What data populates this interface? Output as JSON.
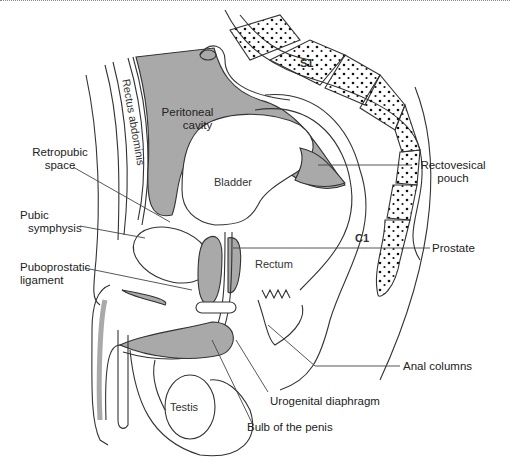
{
  "figure": {
    "colors": {
      "shaded_region": "#a9a9a9",
      "line": "#333333",
      "background": "#ffffff"
    },
    "inline_labels": {
      "rectus_abdominis": "Rectus abdominis",
      "peritoneal_cavity_line1": "Peritoneal",
      "peritoneal_cavity_line2": "cavity",
      "bladder": "Bladder",
      "rectum": "Rectum",
      "testis": "Testis",
      "s1": "S1",
      "c1": "C1"
    },
    "callouts": {
      "retropubic_space_line1": "Retropubic",
      "retropubic_space_line2": "space",
      "pubic_symphysis_line1": "Pubic",
      "pubic_symphysis_line2": "symphysis",
      "puboprostatic_ligament_line1": "Puboprostatic",
      "puboprostatic_ligament_line2": "ligament",
      "rectovesical_pouch_line1": "Rectovesical",
      "rectovesical_pouch_line2": "pouch",
      "prostate": "Prostate",
      "anal_columns": "Anal columns",
      "urogenital_diaphragm": "Urogenital diaphragm",
      "bulb_of_penis": "Bulb of the penis"
    }
  }
}
